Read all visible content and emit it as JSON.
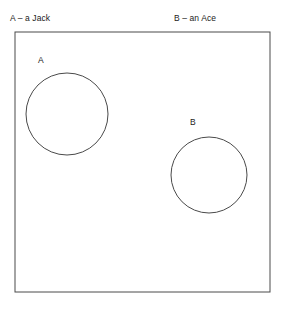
{
  "diagram": {
    "type": "venn-diagram",
    "title": "",
    "captions": [
      {
        "id": "A",
        "text": "A – a Jack"
      },
      {
        "id": "B",
        "text": "B – an Ace"
      }
    ],
    "universe": {
      "name": "universal-set-rectangle",
      "x": 15,
      "y": 32,
      "width": 255,
      "height": 260,
      "stroke": "#4a4a4a",
      "fill": "none"
    },
    "sets": [
      {
        "id": "A",
        "label": "A",
        "description": "a Jack",
        "cx": 67,
        "cy": 114,
        "r": 41,
        "stroke": "#4a4a4a",
        "fill": "none"
      },
      {
        "id": "B",
        "label": "B",
        "description": "an Ace",
        "cx": 209,
        "cy": 175,
        "r": 38,
        "stroke": "#4a4a4a",
        "fill": "none"
      }
    ],
    "overlap": "none",
    "background": "#ffffff"
  }
}
